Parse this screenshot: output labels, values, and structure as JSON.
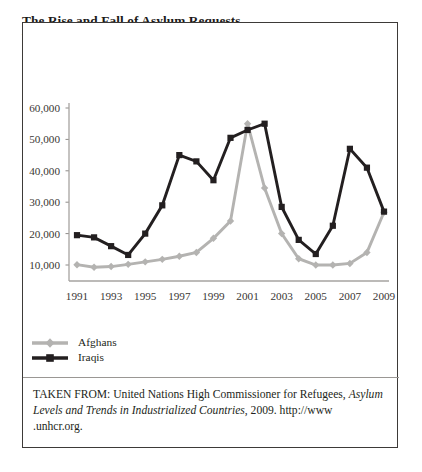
{
  "figure": {
    "title_line1": "The Rise and Fall of Asylum Requests",
    "title_line2": "by Afghans and Iraqis (1991–2009)",
    "source_prefix": "TAKEN FROM: United Nations High Commissioner for Refugees,",
    "source_italic": "Asylum Levels and Trends in Industrialized Countries",
    "source_suffix": ", 2009. http://www",
    "source_line3": ".unhcr.org."
  },
  "legend": {
    "position": "below-plot-left",
    "items": [
      {
        "label": "Afghans",
        "color": "#b4b3b1",
        "marker": "diamond"
      },
      {
        "label": "Iraqis",
        "color": "#231f20",
        "marker": "square"
      }
    ]
  },
  "chart_data": {
    "type": "line",
    "title": "The Rise and Fall of Asylum Requests by Afghans and Iraqis (1991–2009)",
    "xlabel": "",
    "ylabel": "",
    "grid": false,
    "legend_position": "bottom-left",
    "x": [
      1991,
      1992,
      1993,
      1994,
      1995,
      1996,
      1997,
      1998,
      1999,
      2000,
      2001,
      2002,
      2003,
      2004,
      2005,
      2006,
      2007,
      2008,
      2009
    ],
    "xlim": [
      1991,
      2009
    ],
    "xticks": [
      1991,
      1993,
      1995,
      1997,
      1999,
      2001,
      2003,
      2005,
      2007,
      2009
    ],
    "xticklabels": [
      "1991",
      "1993",
      "1995",
      "1997",
      "1999",
      "2001",
      "2003",
      "2005",
      "2007",
      "2009"
    ],
    "ylim": [
      0,
      60000
    ],
    "yticks": [
      10000,
      20000,
      30000,
      40000,
      50000,
      60000
    ],
    "yticklabels": [
      "10,000",
      "20,000",
      "30,000",
      "40,000",
      "50,000",
      "60,000"
    ],
    "series": [
      {
        "name": "Afghans",
        "color": "#b4b3b1",
        "marker": "diamond",
        "values": [
          10100,
          9300,
          9500,
          10200,
          11000,
          11800,
          12800,
          14000,
          18500,
          24000,
          55000,
          34500,
          20000,
          12000,
          10000,
          10000,
          10500,
          14000,
          26800
        ]
      },
      {
        "name": "Iraqis",
        "color": "#231f20",
        "marker": "square",
        "values": [
          19500,
          18800,
          16000,
          13200,
          20000,
          29000,
          45000,
          43000,
          37000,
          50500,
          53000,
          55000,
          28500,
          18000,
          13500,
          22500,
          47000,
          41000,
          27000
        ]
      }
    ]
  }
}
